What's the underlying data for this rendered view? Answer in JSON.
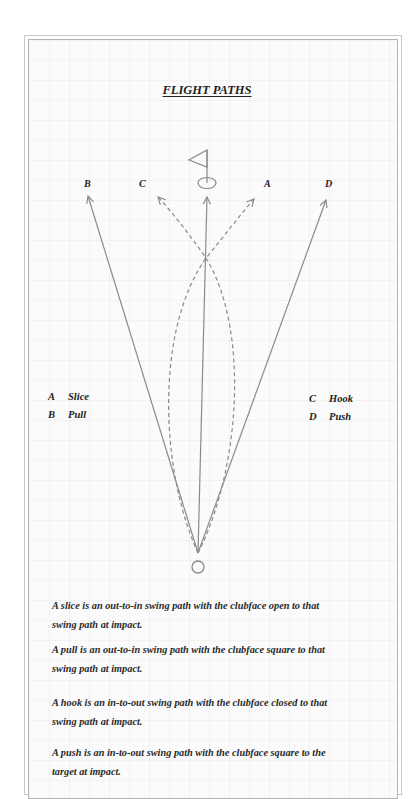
{
  "title": "FLIGHT PATHS",
  "path_labels": {
    "B": "B",
    "C": "C",
    "A": "A",
    "D": "D"
  },
  "legend": {
    "left": [
      {
        "key": "A",
        "label": "Slice"
      },
      {
        "key": "B",
        "label": "Pull"
      }
    ],
    "right": [
      {
        "key": "C",
        "label": "Hook"
      },
      {
        "key": "D",
        "label": "Push"
      }
    ]
  },
  "descriptions": [
    {
      "line1": "A slice is an out-to-in swing path with the clubface open to that",
      "line2": "swing path at impact."
    },
    {
      "line1": "A pull is an out-to-in swing path with the clubface square to that",
      "line2": "swing path at impact."
    },
    {
      "line1": "A hook is an in-to-out swing path with the clubface closed to that",
      "line2": "swing path at impact."
    },
    {
      "line1": "A push is an in-to-out swing path with the clubface square to the",
      "line2": "target at impact."
    }
  ],
  "colors": {
    "line": "#8a8a8a",
    "text": "#222222",
    "frame": "#b5b5b5"
  }
}
